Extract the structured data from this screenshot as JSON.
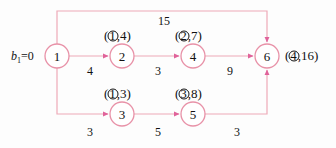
{
  "diagram": {
    "type": "network-flow-graph",
    "colors": {
      "edge": "#eeaab8",
      "node_stroke": "#e892a8",
      "arrowhead": "#e0629a",
      "text": "#111111",
      "background": "#fdfdfd"
    },
    "supply_label": {
      "text": "b",
      "subscript": "1",
      "equals_value": "=0",
      "full": "b1=0"
    },
    "nodes": [
      {
        "id": "1",
        "label": "1",
        "cx": 57,
        "cy": 56,
        "r": 12
      },
      {
        "id": "2",
        "label": "2",
        "cx": 122,
        "cy": 56,
        "r": 12
      },
      {
        "id": "3",
        "label": "3",
        "cx": 122,
        "cy": 114,
        "r": 12
      },
      {
        "id": "4",
        "label": "4",
        "cx": 193,
        "cy": 56,
        "r": 12
      },
      {
        "id": "5",
        "label": "5",
        "cx": 193,
        "cy": 114,
        "r": 12
      },
      {
        "id": "6",
        "label": "6",
        "cx": 267,
        "cy": 56,
        "r": 12
      }
    ],
    "node_pair_labels": [
      {
        "for_node": "2",
        "circled": "1",
        "value": "4",
        "open": "(",
        "comma": ",",
        "close": ")",
        "x": 122,
        "y": 36
      },
      {
        "for_node": "4",
        "circled": "2",
        "value": "7",
        "open": "(",
        "comma": ",",
        "close": ")",
        "x": 193,
        "y": 36
      },
      {
        "for_node": "3",
        "circled": "1",
        "value": "3",
        "open": "(",
        "comma": ",",
        "close": ")",
        "x": 122,
        "y": 94
      },
      {
        "for_node": "5",
        "circled": "3",
        "value": "8",
        "open": "(",
        "comma": ",",
        "close": ")",
        "x": 193,
        "y": 94
      },
      {
        "for_node": "6",
        "circled": "4",
        "value": "16",
        "open": "(",
        "comma": ",",
        "close": ")",
        "x": 300,
        "y": 56
      }
    ],
    "edges": [
      {
        "from": "1",
        "to": "2",
        "weight": "4",
        "wx": 90,
        "wy": 70
      },
      {
        "from": "2",
        "to": "4",
        "weight": "3",
        "wx": 158,
        "wy": 70
      },
      {
        "from": "4",
        "to": "6",
        "weight": "9",
        "wx": 230,
        "wy": 70
      },
      {
        "from": "1",
        "to": "3",
        "weight": "3",
        "wx": 90,
        "wy": 131
      },
      {
        "from": "3",
        "to": "5",
        "weight": "5",
        "wx": 158,
        "wy": 131
      },
      {
        "from": "5",
        "to": "6",
        "weight": "3",
        "wx": 237,
        "wy": 131
      },
      {
        "from": "1",
        "to": "6",
        "weight": "15",
        "wx": 163,
        "wy": 14
      }
    ]
  }
}
